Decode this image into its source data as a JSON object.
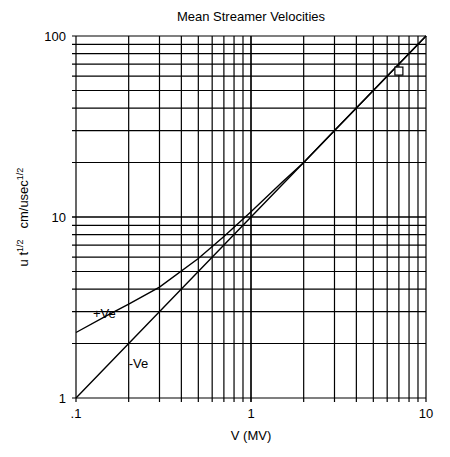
{
  "chart_data": {
    "type": "line",
    "title": "Mean Streamer Velocities",
    "xlabel": "V (MV)",
    "ylabel": {
      "main": "u t",
      "sup1": "1/2",
      "units": "cm/usec",
      "sup2": "1/2"
    },
    "xscale": "log",
    "yscale": "log",
    "xlim": [
      0.1,
      10
    ],
    "ylim": [
      1,
      100
    ],
    "grid": true,
    "x_tick_labels": [
      {
        "value": 0.1,
        "label": ".1"
      },
      {
        "value": 1,
        "label": "1"
      },
      {
        "value": 10,
        "label": "10"
      }
    ],
    "y_tick_labels": [
      {
        "value": 1,
        "label": "1"
      },
      {
        "value": 10,
        "label": "10"
      },
      {
        "value": 100,
        "label": "100"
      }
    ],
    "series": [
      {
        "name": "+Ve",
        "label_pos": {
          "x": 0.125,
          "y": 2.9
        },
        "points": [
          [
            0.1,
            2.3
          ],
          [
            0.15,
            2.85
          ],
          [
            0.2,
            3.3
          ],
          [
            0.3,
            4.1
          ],
          [
            0.5,
            5.9
          ],
          [
            0.7,
            7.8
          ],
          [
            1,
            10.7
          ],
          [
            1.5,
            15.5
          ],
          [
            2,
            20
          ],
          [
            3,
            30
          ],
          [
            5,
            50
          ],
          [
            10,
            100
          ]
        ]
      },
      {
        "name": "-Ve",
        "label_pos": {
          "x": 0.2,
          "y": 1.55
        },
        "points": [
          [
            0.1,
            1
          ],
          [
            1,
            10
          ],
          [
            2,
            20
          ],
          [
            10,
            100
          ]
        ]
      }
    ],
    "markers": [
      {
        "shape": "square",
        "x": 7,
        "y": 64
      }
    ]
  }
}
